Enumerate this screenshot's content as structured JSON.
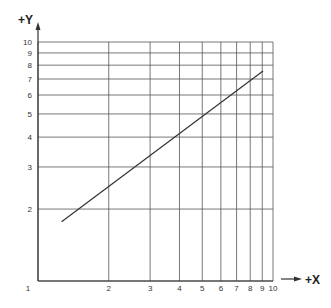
{
  "chart_data": {
    "type": "line",
    "title": "",
    "xlabel": "+X",
    "ylabel": "+Y",
    "x_scale": "log",
    "y_scale": "log",
    "xlim": [
      1,
      10
    ],
    "ylim": [
      1,
      10
    ],
    "x_ticks": [
      1,
      2,
      3,
      4,
      5,
      6,
      7,
      8,
      9,
      10
    ],
    "y_ticks": [
      1,
      2,
      3,
      4,
      5,
      6,
      7,
      8,
      9,
      10
    ],
    "x_tick_labels": [
      "1",
      "2",
      "3",
      "4",
      "5",
      "6",
      "7",
      "8",
      "9",
      "10"
    ],
    "y_tick_labels": [
      "1",
      "2",
      "3",
      "4",
      "5",
      "6",
      "7",
      "8",
      "9",
      "10"
    ],
    "grid": true,
    "legend": null,
    "series": [
      {
        "name": "line",
        "x": [
          1.26,
          9.07
        ],
        "y": [
          1.77,
          7.56
        ]
      }
    ]
  },
  "layout": {
    "plot_left": 38,
    "plot_right": 273,
    "plot_top": 42,
    "plot_bottom": 281,
    "line_color": "#333333",
    "grid_color": "#555555"
  }
}
